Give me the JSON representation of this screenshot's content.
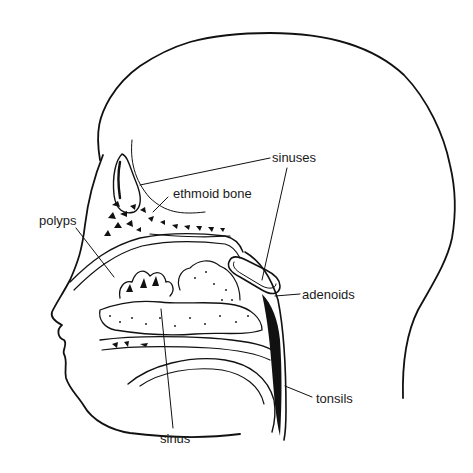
{
  "diagram": {
    "labels": {
      "sinuses": "sinuses",
      "ethmoid": "ethmoid bone",
      "polyps": "polyps",
      "adenoids": "adenoids",
      "tonsils": "tonsils",
      "sinus": "sinus"
    },
    "colors": {
      "ink": "#111111",
      "background": "#ffffff"
    }
  }
}
